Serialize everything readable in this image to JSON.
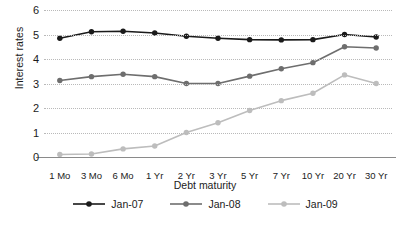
{
  "chart_data": {
    "type": "line",
    "title": "",
    "xlabel": "Debt maturity",
    "ylabel": "Interest rates",
    "categories": [
      "1 Mo",
      "3 Mo",
      "6 Mo",
      "1 Yr",
      "2 Yr",
      "3 Yr",
      "5 Yr",
      "7 Yr",
      "10 Yr",
      "20 Yr",
      "30 Yr"
    ],
    "ylim": [
      0,
      6
    ],
    "yticks": [
      0,
      1,
      2,
      3,
      4,
      5,
      6
    ],
    "grid": "horizontal-dotted",
    "legend_position": "bottom",
    "series": [
      {
        "name": "Jan-07",
        "color": "#1a1a1a",
        "values": [
          4.85,
          5.11,
          5.13,
          5.06,
          4.93,
          4.85,
          4.79,
          4.78,
          4.79,
          5.0,
          4.9
        ]
      },
      {
        "name": "Jan-08",
        "color": "#6e6e6e",
        "values": [
          3.12,
          3.28,
          3.38,
          3.28,
          3.0,
          3.0,
          3.3,
          3.6,
          3.85,
          4.5,
          4.45
        ]
      },
      {
        "name": "Jan-09",
        "color": "#bdbdbd",
        "values": [
          0.1,
          0.12,
          0.33,
          0.45,
          1.0,
          1.4,
          1.9,
          2.3,
          2.6,
          3.35,
          3.0
        ]
      }
    ]
  },
  "axis": {
    "y_title": "Interest rates",
    "x_title": "Debt maturity"
  }
}
